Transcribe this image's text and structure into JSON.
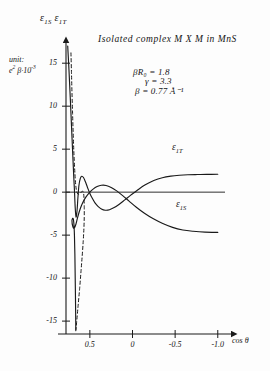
{
  "figure": {
    "title": "Isolated complex M X M in MnS",
    "y_axis_title": "ε₁ₛ ε₁ₜ",
    "y_axis_title_parts": [
      "ε",
      "1S",
      "ε",
      "1T"
    ],
    "unit_line1": "unit:",
    "unit_line2": "e² β·10⁻³",
    "x_axis_title": "cos θ",
    "parameters": [
      "βR₀ = 1.8",
      "γ = 3.3",
      "β = 0.77 Å⁻¹"
    ],
    "curve_labels": {
      "upper": "ε₁ₜ",
      "lower": "ε₁ₛ"
    },
    "ink_color": "#1a1a1a",
    "background_color": "#fdfdfd"
  },
  "chart_data": {
    "type": "line",
    "title": "Isolated complex M X M in MnS",
    "xlabel": "cos θ",
    "ylabel": "ε₁ₛ ε₁ₜ",
    "unit_note": "unit: e² β·10⁻³",
    "xlim": [
      0.78,
      -1.12
    ],
    "ylim": [
      -16.5,
      17.0
    ],
    "x_ticks": [
      0.5,
      0,
      -0.5,
      -1.0
    ],
    "x_tick_labels": [
      "0.5",
      "0",
      "-0.5",
      "-1.0"
    ],
    "y_ticks": [
      15,
      10,
      5,
      0,
      -5,
      -10,
      -15
    ],
    "y_tick_labels": [
      "15",
      "10",
      "5",
      "0",
      "-5",
      "-10",
      "-15"
    ],
    "grid": false,
    "legend": "inline-curve-labels",
    "x_axis_direction": "decreasing-left-to-right",
    "annotations": [
      {
        "text": "βR₀ = 1.8",
        "x": 0.12,
        "y": 12.2
      },
      {
        "text": "γ = 3.3",
        "x": 0.08,
        "y": 10.6
      },
      {
        "text": "β = 0.77 Å⁻¹",
        "x": 0.1,
        "y": 9.0
      }
    ],
    "series": [
      {
        "name": "ε₁ₜ",
        "style": "solid",
        "label_position": {
          "x": -0.62,
          "y": 2.6
        },
        "points": [
          [
            0.76,
            17.0
          ],
          [
            0.745,
            14.2
          ],
          [
            0.73,
            11.0
          ],
          [
            0.715,
            7.6
          ],
          [
            0.7,
            4.2
          ],
          [
            0.688,
            1.6
          ],
          [
            0.68,
            0.0
          ],
          [
            0.672,
            -1.8
          ],
          [
            0.662,
            -2.9
          ],
          [
            0.65,
            -2.1
          ],
          [
            0.64,
            -0.6
          ],
          [
            0.628,
            0.8
          ],
          [
            0.612,
            1.6
          ],
          [
            0.595,
            1.85
          ],
          [
            0.575,
            1.7
          ],
          [
            0.552,
            1.2
          ],
          [
            0.528,
            0.55
          ],
          [
            0.5,
            -0.15
          ],
          [
            0.47,
            -0.75
          ],
          [
            0.44,
            -1.25
          ],
          [
            0.405,
            -1.65
          ],
          [
            0.365,
            -1.95
          ],
          [
            0.32,
            -2.1
          ],
          [
            0.27,
            -2.05
          ],
          [
            0.215,
            -1.8
          ],
          [
            0.155,
            -1.4
          ],
          [
            0.09,
            -0.9
          ],
          [
            0.02,
            -0.35
          ],
          [
            -0.06,
            0.25
          ],
          [
            -0.15,
            0.85
          ],
          [
            -0.25,
            1.35
          ],
          [
            -0.35,
            1.68
          ],
          [
            -0.45,
            1.86
          ],
          [
            -0.55,
            1.96
          ],
          [
            -0.65,
            2.02
          ],
          [
            -0.76,
            2.05
          ],
          [
            -0.87,
            2.07
          ],
          [
            -1.0,
            2.08
          ]
        ]
      },
      {
        "name": "ε₁ₛ",
        "style": "solid",
        "label_position": {
          "x": -0.6,
          "y": -3.6
        },
        "points": [
          [
            0.665,
            -16.0
          ],
          [
            0.668,
            -13.0
          ],
          [
            0.672,
            -10.0
          ],
          [
            0.676,
            -7.2
          ],
          [
            0.681,
            -5.0
          ],
          [
            0.688,
            -3.6
          ],
          [
            0.697,
            -3.05
          ],
          [
            0.71,
            -3.3
          ],
          [
            0.7,
            -4.0
          ],
          [
            0.683,
            -4.2
          ],
          [
            0.663,
            -3.7
          ],
          [
            0.64,
            -2.8
          ],
          [
            0.612,
            -1.9
          ],
          [
            0.58,
            -1.15
          ],
          [
            0.545,
            -0.55
          ],
          [
            0.505,
            -0.05
          ],
          [
            0.462,
            0.35
          ],
          [
            0.415,
            0.65
          ],
          [
            0.365,
            0.8
          ],
          [
            0.31,
            0.78
          ],
          [
            0.25,
            0.55
          ],
          [
            0.185,
            0.15
          ],
          [
            0.115,
            -0.4
          ],
          [
            0.04,
            -1.05
          ],
          [
            -0.045,
            -1.75
          ],
          [
            -0.14,
            -2.45
          ],
          [
            -0.245,
            -3.1
          ],
          [
            -0.355,
            -3.65
          ],
          [
            -0.47,
            -4.1
          ],
          [
            -0.59,
            -4.4
          ],
          [
            -0.71,
            -4.55
          ],
          [
            -0.85,
            -4.65
          ],
          [
            -1.0,
            -4.68
          ]
        ]
      },
      {
        "name": "dashed-branch",
        "style": "dashed",
        "points": [
          [
            0.722,
            16.2
          ],
          [
            0.716,
            14.0
          ],
          [
            0.71,
            11.6
          ],
          [
            0.703,
            9.2
          ],
          [
            0.696,
            6.9
          ],
          [
            0.688,
            4.7
          ],
          [
            0.679,
            2.8
          ],
          [
            0.67,
            1.3
          ],
          [
            0.66,
            0.35
          ],
          [
            0.648,
            -0.1
          ],
          [
            0.634,
            -0.25
          ],
          [
            0.618,
            -0.18
          ],
          [
            0.602,
            0.0
          ],
          [
            0.588,
            0.1
          ],
          [
            0.578,
            0.05
          ],
          [
            0.572,
            -0.25
          ],
          [
            0.568,
            -0.9
          ],
          [
            0.566,
            -1.8
          ],
          [
            0.566,
            -2.9
          ],
          [
            0.57,
            -4.2
          ],
          [
            0.578,
            -5.7
          ],
          [
            0.59,
            -7.4
          ],
          [
            0.604,
            -9.2
          ],
          [
            0.62,
            -11.2
          ],
          [
            0.638,
            -13.2
          ],
          [
            0.656,
            -15.2
          ],
          [
            0.666,
            -16.2
          ]
        ]
      }
    ]
  }
}
